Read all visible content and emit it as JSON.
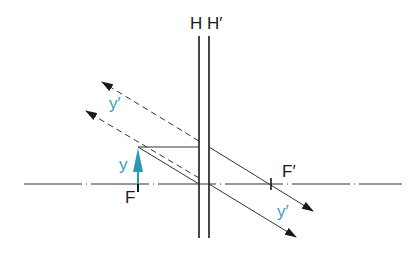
{
  "diagram": {
    "type": "optics-principal-planes-ray-construction",
    "labels": {
      "principal_plane_object": "H",
      "principal_plane_image": "H′",
      "focal_point_object": "F",
      "focal_point_image": "F′",
      "object": "y",
      "image_upper": "y′",
      "image_lower": "y′"
    },
    "colors": {
      "line": "#1a1a1a",
      "object_arrow": "#2a9aae",
      "accent_label": "#3a9fc0",
      "background": "#ffffff"
    }
  }
}
